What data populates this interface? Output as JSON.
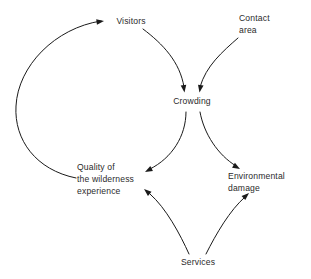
{
  "diagram": {
    "type": "causal-loop-diagram",
    "background_color": "#ffffff",
    "line_color": "#1a1a1a",
    "text_color": "#2b2b2b",
    "nodes": [
      {
        "id": "visitors",
        "label": "Visitors",
        "lines": [
          "Visitors"
        ],
        "x": 131,
        "y": 24,
        "align": "center"
      },
      {
        "id": "contact-area",
        "label": "Contact area",
        "lines": [
          "Contact",
          "area"
        ],
        "x": 239,
        "y": 21,
        "align": "start"
      },
      {
        "id": "crowding",
        "label": "Crowding",
        "lines": [
          "Crowding"
        ],
        "x": 192,
        "y": 104,
        "align": "center"
      },
      {
        "id": "quality-of-the-wilderness-experience",
        "label": "Quality of the wilderness experience",
        "lines": [
          "Quality of",
          "the wilderness",
          "experience"
        ],
        "x": 77,
        "y": 170,
        "align": "start"
      },
      {
        "id": "environmental-damage",
        "label": "Environmental damage",
        "lines": [
          "Environmental",
          "damage"
        ],
        "x": 228,
        "y": 179,
        "align": "start"
      },
      {
        "id": "services",
        "label": "Services",
        "lines": [
          "Services"
        ],
        "x": 198,
        "y": 265,
        "align": "center"
      }
    ],
    "edges": [
      {
        "id": "quality-to-visitors",
        "from": "quality-of-the-wilderness-experience",
        "to": "visitors",
        "path": "M 76,178 C 36,170 14,140 16,106 C 18,66 55,28 101,21",
        "arrow": {
          "x": 104,
          "y": 21,
          "angle": -8
        }
      },
      {
        "id": "visitors-to-crowding",
        "from": "visitors",
        "to": "crowding",
        "path": "M 143,29 C 163,44 180,62 184,87",
        "arrow": {
          "x": 184.5,
          "y": 92,
          "angle": 82
        }
      },
      {
        "id": "contact-area-to-crowding",
        "from": "contact-area",
        "to": "crowding",
        "path": "M 238,38 C 222,52 206,66 200,87",
        "arrow": {
          "x": 199.5,
          "y": 92,
          "angle": 100
        }
      },
      {
        "id": "crowding-to-quality",
        "from": "crowding",
        "to": "quality-of-the-wilderness-experience",
        "path": "M 186,112 C 186,136 172,158 150,169",
        "arrow": {
          "x": 145,
          "y": 172,
          "angle": 152
        }
      },
      {
        "id": "crowding-to-environmental-damage",
        "from": "crowding",
        "to": "environmental-damage",
        "path": "M 200,112 C 204,134 218,155 236,166",
        "arrow": {
          "x": 240,
          "y": 169,
          "angle": 30
        }
      },
      {
        "id": "services-to-quality",
        "from": "services",
        "to": "quality-of-the-wilderness-experience",
        "path": "M 189,254 C 180,234 166,208 150,194",
        "arrow": {
          "x": 145,
          "y": 190,
          "angle": 220
        }
      },
      {
        "id": "services-to-environmental-damage",
        "from": "services",
        "to": "environmental-damage",
        "path": "M 206,254 C 216,234 230,210 245,197",
        "arrow": {
          "x": 249,
          "y": 193,
          "angle": -42
        }
      }
    ]
  }
}
